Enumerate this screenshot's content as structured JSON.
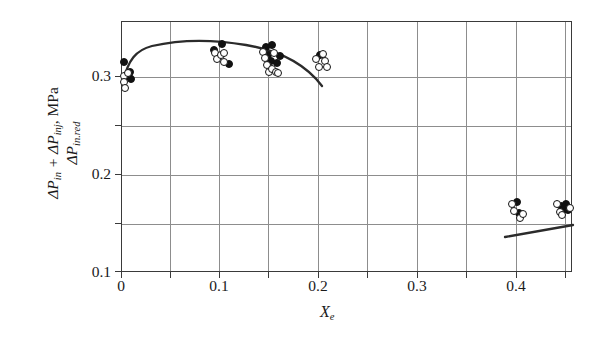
{
  "figure": {
    "kind": "scatter-with-fitted-curves",
    "background": "#ffffff",
    "frame_color": "#3a3a3a",
    "grid_color": "#8d8d8d",
    "marker_color": "#111111"
  },
  "axes": {
    "y_title_numerator": "ΔP",
    "y_title": {
      "numerator_prefix": "ΔP",
      "numerator_sub1": "in",
      "numerator_plus": " + ΔP",
      "numerator_sub2": "inj",
      "numerator_units": ", MPa",
      "denominator_prefix": "ΔP",
      "denominator_sub": "in.red"
    },
    "x_title_symbol": "X",
    "x_title_sub": "e",
    "x_ticks": [
      "0",
      "0.1",
      "0.2",
      "0.3",
      "0.4"
    ],
    "y_ticks": [
      "0.1",
      "0.2",
      "0.3"
    ]
  },
  "chart_data": {
    "type": "scatter",
    "title": "",
    "xlabel": "Xe",
    "ylabel": "(ΔP_in + ΔP_inj) / ΔP_in.red, MPa",
    "xlim": [
      0,
      0.4555
    ],
    "ylim": [
      0.1,
      0.3561
    ],
    "xticks": [
      0,
      0.1,
      0.2,
      0.3,
      0.4
    ],
    "yticks": [
      0.1,
      0.2,
      0.3
    ],
    "x_minor_step": 0.05,
    "y_minor_step": 0.05,
    "grid": true,
    "legend": null,
    "series": [
      {
        "name": "filled-circles",
        "marker": "filled circle",
        "points": [
          [
            0.0015,
            0.3155
          ],
          [
            0.0075,
            0.3
          ],
          [
            0.0085,
            0.3055
          ],
          [
            0.0095,
            0.298
          ],
          [
            0.0925,
            0.328
          ],
          [
            0.101,
            0.3335
          ],
          [
            0.108,
            0.313
          ],
          [
            0.145,
            0.331
          ],
          [
            0.147,
            0.3225
          ],
          [
            0.15,
            0.316
          ],
          [
            0.152,
            0.333
          ],
          [
            0.157,
            0.314
          ],
          [
            0.1595,
            0.3215
          ],
          [
            0.2,
            0.3225
          ],
          [
            0.3985,
            0.172
          ],
          [
            0.401,
            0.161
          ],
          [
            0.443,
            0.168
          ],
          [
            0.446,
            0.1655
          ],
          [
            0.448,
            0.17
          ],
          [
            0.4505,
            0.164
          ]
        ]
      },
      {
        "name": "open-circles",
        "marker": "open circle",
        "points": [
          [
            0.002,
            0.301
          ],
          [
            0.0025,
            0.2945
          ],
          [
            0.003,
            0.2885
          ],
          [
            0.006,
            0.304
          ],
          [
            0.0935,
            0.324
          ],
          [
            0.096,
            0.3185
          ],
          [
            0.1,
            0.3225
          ],
          [
            0.103,
            0.324
          ],
          [
            0.1035,
            0.3155
          ],
          [
            0.142,
            0.3255
          ],
          [
            0.144,
            0.319
          ],
          [
            0.1465,
            0.312
          ],
          [
            0.148,
            0.3055
          ],
          [
            0.151,
            0.3085
          ],
          [
            0.154,
            0.324
          ],
          [
            0.156,
            0.305
          ],
          [
            0.158,
            0.3045
          ],
          [
            0.196,
            0.318
          ],
          [
            0.1985,
            0.31
          ],
          [
            0.2035,
            0.323
          ],
          [
            0.2055,
            0.3165
          ],
          [
            0.2075,
            0.31
          ],
          [
            0.394,
            0.17
          ],
          [
            0.3955,
            0.163
          ],
          [
            0.402,
            0.1565
          ],
          [
            0.4045,
            0.16
          ],
          [
            0.4395,
            0.17
          ],
          [
            0.442,
            0.1625
          ],
          [
            0.444,
            0.1595
          ],
          [
            0.452,
            0.1665
          ]
        ]
      }
    ],
    "fit_curves": [
      {
        "name": "left-fit",
        "x_range": [
          0.0,
          0.2415
        ],
        "description": "rising then gently falling arc peaking near x=0.13 at y≈0.327"
      },
      {
        "name": "right-fit",
        "x_range": [
          0.391,
          0.4555
        ],
        "description": "slightly rising straight segment from y≈0.163 to y≈0.170"
      }
    ]
  }
}
